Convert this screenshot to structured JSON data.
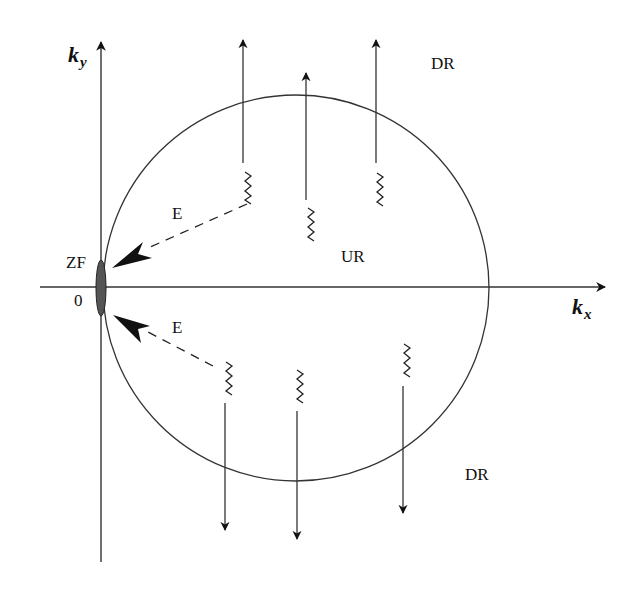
{
  "diagram": {
    "axes": {
      "x_label": "k",
      "x_subscript": "x",
      "y_label": "k",
      "y_subscript": "y",
      "origin_label": "0"
    },
    "regions": {
      "zero_field": "ZF",
      "upper_region": "UR",
      "down_region_top": "DR",
      "down_region_bottom": "DR"
    },
    "emission_labels": {
      "upper": "E",
      "lower": "E"
    },
    "colors": {
      "stroke": "#222222",
      "background": "#ffffff",
      "zf_fill": "#555555"
    },
    "elements": {
      "circle": {
        "cx": 296,
        "cy": 288,
        "r": 193
      },
      "up_arrows": 3,
      "down_arrows": 3,
      "zigzags_upper": 3,
      "zigzags_lower": 3
    }
  }
}
